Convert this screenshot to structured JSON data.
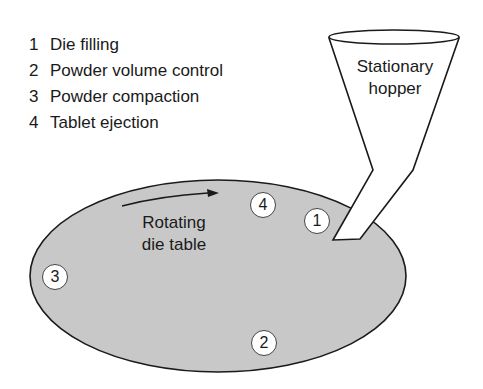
{
  "legend": {
    "items": [
      {
        "num": "1",
        "label": "Die filling"
      },
      {
        "num": "2",
        "label": "Powder volume control"
      },
      {
        "num": "3",
        "label": "Powder compaction"
      },
      {
        "num": "4",
        "label": "Tablet ejection"
      }
    ]
  },
  "hopper": {
    "line1": "Stationary",
    "line2": "hopper"
  },
  "die_table": {
    "line1": "Rotating",
    "line2": "die table"
  },
  "stations": [
    {
      "num": "1",
      "x": 317,
      "y": 221
    },
    {
      "num": "2",
      "x": 264,
      "y": 343
    },
    {
      "num": "3",
      "x": 55,
      "y": 277
    },
    {
      "num": "4",
      "x": 263,
      "y": 205
    }
  ],
  "colors": {
    "table_fill": "#c8c8c8",
    "outline": "#1a1a1a",
    "hopper_fill": "#ffffff"
  }
}
